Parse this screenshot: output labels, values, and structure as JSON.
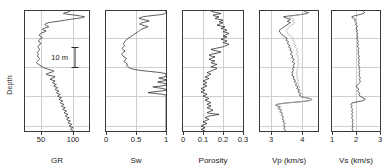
{
  "figure": {
    "type": "well-log-panel-plot",
    "depth_axis_label": "Depth",
    "scale_bar": {
      "label": "10 m",
      "name": "depth-scale-bar"
    },
    "background_color": "#ffffff",
    "frame_color": "#3a3a3a",
    "grid_color": "#cfcfcf",
    "curve_color": "#1a1a1a",
    "secondary_curve_color": "#a8a8a8"
  },
  "chart_data": [
    {
      "type": "line",
      "name": "gamma-ray",
      "title": "GR",
      "xlabel": "GR",
      "ylabel": "Depth",
      "orientation": "vertical-depth",
      "grid": true,
      "xlim": [
        25,
        125
      ],
      "xticks": [
        50,
        100
      ],
      "xticklabels": [
        "50",
        "100"
      ],
      "ylim": [
        0,
        1
      ],
      "yticks": [
        0.22,
        0.46,
        0.7,
        0.94
      ],
      "annotation": "10 m",
      "series": [
        {
          "name": "GR",
          "color": "#1a1a1a",
          "x": [
            96,
            94,
            88,
            85,
            92,
            103,
            112,
            118,
            115,
            105,
            96,
            88,
            80,
            70,
            62,
            58,
            56,
            57,
            60,
            62,
            58,
            54,
            52,
            54,
            58,
            56,
            52,
            50,
            48,
            47,
            48,
            50,
            52,
            50,
            48,
            47,
            46,
            47,
            49,
            50,
            48,
            47,
            46,
            45,
            46,
            47,
            48,
            47,
            46,
            45,
            44,
            45,
            46,
            45,
            44,
            45,
            47,
            48,
            47,
            46,
            45,
            44,
            43,
            44,
            46,
            48,
            50,
            52,
            54,
            58,
            62,
            66,
            70,
            68,
            64,
            60,
            58,
            62,
            68,
            72,
            70,
            66,
            64,
            68,
            72,
            70,
            68,
            70,
            74,
            72,
            70,
            72,
            76,
            74,
            72,
            74,
            78,
            76,
            74,
            76,
            80,
            78,
            76,
            78,
            82,
            80,
            78,
            80,
            84,
            82,
            80,
            82,
            86,
            84,
            82,
            84,
            88,
            86,
            84,
            86,
            90,
            88,
            86,
            88,
            92,
            90,
            88,
            90,
            94,
            92,
            90,
            92,
            96,
            94,
            92,
            94,
            98,
            96,
            94,
            96,
            100,
            98,
            96,
            98,
            100
          ],
          "y_normalized_range": [
            0,
            1
          ]
        }
      ]
    },
    {
      "type": "line",
      "name": "water-saturation",
      "title": "Sw",
      "xlabel": "Sw",
      "ylabel": "Depth",
      "orientation": "vertical-depth",
      "grid": true,
      "xlim": [
        0,
        1
      ],
      "xticks": [
        0,
        0.5,
        1
      ],
      "xticklabels": [
        "0",
        "0.5",
        "1"
      ],
      "series": [
        {
          "name": "Sw",
          "color": "#1a1a1a",
          "x": [
            1,
            1,
            1,
            0.98,
            0.95,
            0.85,
            0.72,
            0.62,
            0.58,
            0.55,
            0.6,
            0.66,
            0.72,
            0.68,
            0.62,
            0.58,
            0.56,
            0.6,
            0.64,
            0.7,
            0.68,
            0.64,
            0.6,
            0.58,
            0.56,
            0.54,
            0.52,
            0.5,
            0.48,
            0.46,
            0.44,
            0.42,
            0.4,
            0.38,
            0.36,
            0.34,
            0.33,
            0.32,
            0.31,
            0.3,
            0.29,
            0.3,
            0.31,
            0.3,
            0.29,
            0.28,
            0.27,
            0.28,
            0.3,
            0.32,
            0.3,
            0.28,
            0.27,
            0.26,
            0.27,
            0.28,
            0.3,
            0.32,
            0.34,
            0.33,
            0.32,
            0.31,
            0.3,
            0.32,
            0.34,
            0.36,
            0.35,
            0.34,
            0.36,
            0.38,
            0.4,
            0.44,
            0.5,
            0.6,
            0.72,
            0.86,
            0.95,
            1,
            1,
            1,
            1,
            0.96,
            0.88,
            0.92,
            1,
            1,
            0.94,
            0.86,
            0.92,
            1,
            1,
            1,
            0.9,
            0.78,
            0.86,
            0.95,
            1,
            1,
            0.92,
            0.8,
            0.7,
            0.82,
            0.94,
            1,
            1,
            1,
            1,
            1,
            1,
            1,
            1,
            1,
            1,
            1,
            1,
            1,
            1,
            1,
            1,
            1,
            1,
            1,
            1,
            1,
            1,
            1,
            1,
            1,
            1,
            1,
            1,
            1,
            1,
            1,
            1,
            1,
            1,
            1,
            1,
            1,
            1,
            1,
            1,
            1,
            1,
            1,
            1,
            1
          ]
        }
      ]
    },
    {
      "type": "line",
      "name": "porosity",
      "title": "Porosity",
      "xlabel": "Porosity",
      "ylabel": "Depth",
      "orientation": "vertical-depth",
      "grid": true,
      "xlim": [
        0,
        0.3
      ],
      "xticks": [
        0,
        0.1,
        0.2,
        0.3
      ],
      "xticklabels": [
        "0",
        "0.1",
        "0.2",
        "0.3"
      ],
      "series": [
        {
          "name": "Porosity",
          "color": "#1a1a1a",
          "x": [
            0.14,
            0.15,
            0.17,
            0.19,
            0.17,
            0.15,
            0.16,
            0.18,
            0.17,
            0.16,
            0.18,
            0.2,
            0.19,
            0.18,
            0.2,
            0.19,
            0.18,
            0.17,
            0.19,
            0.21,
            0.2,
            0.19,
            0.21,
            0.22,
            0.21,
            0.2,
            0.22,
            0.23,
            0.22,
            0.21,
            0.2,
            0.22,
            0.21,
            0.2,
            0.19,
            0.21,
            0.22,
            0.21,
            0.2,
            0.22,
            0.23,
            0.22,
            0.21,
            0.2,
            0.18,
            0.16,
            0.14,
            0.15,
            0.17,
            0.19,
            0.18,
            0.16,
            0.14,
            0.13,
            0.14,
            0.16,
            0.15,
            0.14,
            0.13,
            0.14,
            0.16,
            0.15,
            0.14,
            0.15,
            0.17,
            0.16,
            0.15,
            0.14,
            0.16,
            0.17,
            0.16,
            0.15,
            0.14,
            0.13,
            0.12,
            0.13,
            0.14,
            0.13,
            0.12,
            0.11,
            0.12,
            0.13,
            0.12,
            0.11,
            0.1,
            0.11,
            0.12,
            0.11,
            0.1,
            0.11,
            0.12,
            0.11,
            0.1,
            0.09,
            0.1,
            0.11,
            0.1,
            0.09,
            0.1,
            0.11,
            0.12,
            0.11,
            0.1,
            0.11,
            0.12,
            0.13,
            0.12,
            0.11,
            0.12,
            0.13,
            0.14,
            0.13,
            0.12,
            0.13,
            0.14,
            0.13,
            0.12,
            0.13,
            0.14,
            0.15,
            0.14,
            0.13,
            0.12,
            0.14,
            0.18,
            0.16,
            0.13,
            0.12,
            0.11,
            0.12,
            0.13,
            0.12,
            0.11,
            0.1,
            0.11,
            0.12,
            0.11,
            0.1,
            0.09,
            0.1,
            0.11,
            0.1,
            0.09,
            0.1,
            0.11
          ]
        }
      ]
    },
    {
      "type": "line",
      "name": "p-wave-velocity",
      "title": "Vp (km/s)",
      "xlabel": "Vp (km/s)",
      "ylabel": "Depth",
      "orientation": "vertical-depth",
      "grid": true,
      "xlim": [
        2.65,
        4.5
      ],
      "xticks": [
        3,
        4
      ],
      "xticklabels": [
        "3",
        "4"
      ],
      "series": [
        {
          "name": "Vp measured",
          "color": "#1a1a1a",
          "x": [
            4.05,
            4.1,
            4.2,
            4.15,
            4.0,
            3.8,
            3.55,
            3.4,
            3.45,
            3.55,
            3.62,
            3.58,
            3.52,
            3.56,
            3.62,
            3.58,
            3.54,
            3.5,
            3.46,
            3.42,
            3.38,
            3.34,
            3.3,
            3.28,
            3.26,
            3.28,
            3.3,
            3.32,
            3.34,
            3.36,
            3.4,
            3.44,
            3.48,
            3.52,
            3.5,
            3.48,
            3.52,
            3.56,
            3.54,
            3.52,
            3.56,
            3.6,
            3.58,
            3.56,
            3.6,
            3.64,
            3.62,
            3.6,
            3.64,
            3.68,
            3.66,
            3.64,
            3.62,
            3.66,
            3.7,
            3.68,
            3.66,
            3.7,
            3.74,
            3.72,
            3.7,
            3.68,
            3.72,
            3.76,
            3.74,
            3.72,
            3.7,
            3.74,
            3.72,
            3.7,
            3.68,
            3.72,
            3.7,
            3.68,
            3.66,
            3.7,
            3.68,
            3.66,
            3.7,
            3.74,
            3.72,
            3.7,
            3.74,
            3.78,
            3.76,
            3.74,
            3.78,
            3.82,
            3.8,
            3.78,
            3.82,
            3.86,
            3.84,
            3.82,
            3.86,
            3.9,
            3.88,
            3.86,
            3.9,
            3.94,
            3.92,
            3.9,
            3.94,
            3.98,
            4.1,
            4.25,
            4.3,
            4.28,
            4.15,
            3.9,
            3.6,
            3.35,
            3.2,
            3.15,
            3.2,
            3.3,
            3.28,
            3.22,
            3.28,
            3.35,
            3.32,
            3.28,
            3.33,
            3.38,
            3.35,
            3.32,
            3.36,
            3.4,
            3.38,
            3.35,
            3.38,
            3.42,
            3.4,
            3.38,
            3.42,
            3.45,
            3.43,
            3.4,
            3.42,
            3.45,
            3.43,
            3.41,
            3.44,
            3.46,
            3.44
          ]
        },
        {
          "name": "Vp modeled",
          "color": "#a8a8a8",
          "x": [
            4.05,
            4.1,
            4.18,
            4.12,
            3.98,
            3.82,
            3.66,
            3.58,
            3.62,
            3.68,
            3.74,
            3.72,
            3.68,
            3.72,
            3.76,
            3.74,
            3.7,
            3.66,
            3.62,
            3.58,
            3.56,
            3.54,
            3.52,
            3.5,
            3.48,
            3.5,
            3.52,
            3.54,
            3.56,
            3.58,
            3.62,
            3.66,
            3.7,
            3.72,
            3.7,
            3.68,
            3.72,
            3.76,
            3.74,
            3.72,
            3.76,
            3.8,
            3.78,
            3.76,
            3.8,
            3.84,
            3.82,
            3.8,
            3.84,
            3.86,
            3.84,
            3.82,
            3.8,
            3.84,
            3.88,
            3.86,
            3.84,
            3.88,
            3.9,
            3.88,
            3.86,
            3.84,
            3.88,
            3.9,
            3.88,
            3.86,
            3.84,
            3.88,
            3.86,
            3.84,
            3.82,
            3.86,
            3.84,
            3.82,
            3.8,
            3.84,
            3.82,
            3.8,
            3.84,
            3.86,
            3.84,
            3.82,
            3.86,
            3.88,
            3.86,
            3.84,
            3.88,
            3.9,
            3.88,
            3.86,
            3.9,
            3.92,
            3.9,
            3.88,
            3.92,
            3.94,
            3.92,
            3.9,
            3.94,
            3.96,
            3.94,
            3.92,
            3.96,
            3.98,
            4.1,
            4.25,
            4.3,
            4.28,
            4.15,
            3.9,
            3.6,
            3.35,
            3.2,
            3.15,
            3.2,
            3.3,
            3.28,
            3.22,
            3.28,
            3.35,
            3.32,
            3.28,
            3.33,
            3.38,
            3.35,
            3.32,
            3.36,
            3.4,
            3.38,
            3.35,
            3.38,
            3.42,
            3.4,
            3.38,
            3.42,
            3.45,
            3.43,
            3.4,
            3.42,
            3.45,
            3.43,
            3.41,
            3.44,
            3.46,
            3.44
          ]
        }
      ]
    },
    {
      "type": "line",
      "name": "s-wave-velocity",
      "title": "Vs (km/s)",
      "xlabel": "Vs (km/s)",
      "ylabel": "Depth",
      "orientation": "vertical-depth",
      "grid": true,
      "xlim": [
        1,
        3
      ],
      "xticks": [
        1,
        2,
        3
      ],
      "xticklabels": [
        "1",
        "2",
        "3"
      ],
      "series": [
        {
          "name": "Vs",
          "color": "#1a1a1a",
          "x": [
            2.3,
            2.32,
            2.35,
            2.3,
            2.2,
            2.05,
            1.9,
            1.82,
            1.85,
            1.92,
            1.98,
            1.96,
            1.94,
            1.98,
            2.02,
            2.0,
            1.98,
            2.02,
            2.06,
            2.04,
            2.02,
            2.0,
            2.04,
            2.06,
            2.04,
            2.02,
            2.06,
            2.08,
            2.06,
            2.04,
            2.06,
            2.08,
            2.06,
            2.04,
            2.06,
            2.08,
            2.1,
            2.08,
            2.06,
            2.08,
            2.1,
            2.08,
            2.06,
            2.08,
            2.1,
            2.12,
            2.1,
            2.08,
            2.1,
            2.12,
            2.1,
            2.08,
            2.1,
            2.12,
            2.14,
            2.12,
            2.1,
            2.12,
            2.14,
            2.12,
            2.1,
            2.12,
            2.14,
            2.12,
            2.1,
            2.12,
            2.14,
            2.16,
            2.14,
            2.12,
            2.14,
            2.16,
            2.14,
            2.12,
            2.14,
            2.16,
            2.14,
            2.12,
            2.14,
            2.16,
            2.18,
            2.16,
            2.14,
            2.16,
            2.18,
            2.16,
            2.14,
            2.1,
            2.06,
            2.02,
            2.0,
            2.04,
            2.08,
            2.12,
            2.1,
            2.06,
            2.08,
            2.12,
            2.16,
            2.14,
            2.12,
            2.16,
            2.2,
            2.26,
            2.32,
            2.38,
            2.36,
            2.28,
            2.1,
            1.92,
            1.82,
            1.78,
            1.8,
            1.84,
            1.82,
            1.8,
            1.82,
            1.86,
            1.84,
            1.82,
            1.84,
            1.86,
            1.84,
            1.82,
            1.84,
            1.86,
            1.84,
            1.82,
            1.84,
            1.86,
            1.88,
            1.86,
            1.84,
            1.86,
            1.88,
            1.86,
            1.84,
            1.86,
            1.88,
            1.86,
            1.84,
            1.86,
            1.88,
            1.86
          ]
        }
      ]
    }
  ]
}
